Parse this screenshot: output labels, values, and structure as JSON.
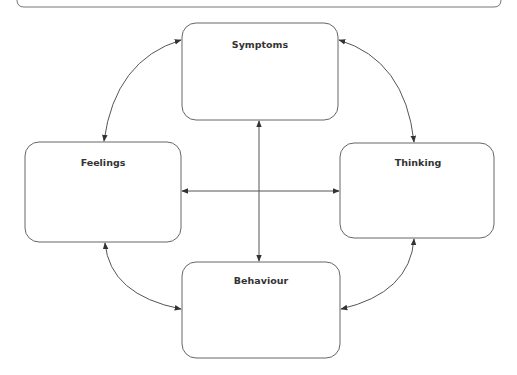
{
  "diagram": {
    "type": "cycle",
    "nodes": [
      {
        "id": "symptoms",
        "label": "Symptoms"
      },
      {
        "id": "feelings",
        "label": "Feelings"
      },
      {
        "id": "thinking",
        "label": "Thinking"
      },
      {
        "id": "behaviour",
        "label": "Behaviour"
      }
    ],
    "edges": [
      {
        "from": "symptoms",
        "to": "feelings",
        "bidirectional": true
      },
      {
        "from": "symptoms",
        "to": "thinking",
        "bidirectional": true
      },
      {
        "from": "feelings",
        "to": "behaviour",
        "bidirectional": true
      },
      {
        "from": "thinking",
        "to": "behaviour",
        "bidirectional": true
      },
      {
        "from": "symptoms",
        "to": "behaviour",
        "bidirectional": true
      },
      {
        "from": "feelings",
        "to": "thinking",
        "bidirectional": true
      }
    ],
    "colors": {
      "stroke": "#555555",
      "text": "#333333",
      "background": "#ffffff"
    }
  }
}
